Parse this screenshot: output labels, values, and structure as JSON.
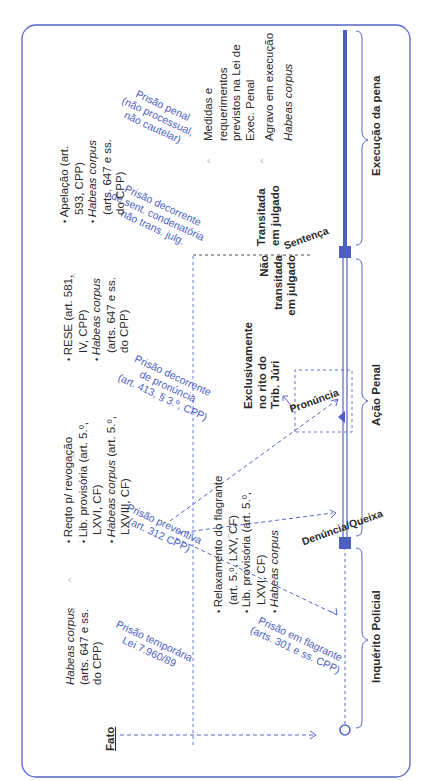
{
  "diagram": {
    "start_label": "Fato",
    "phases": [
      {
        "label": "Inquérito Policial"
      },
      {
        "label": "Ação Penal"
      },
      {
        "label": "Execução da pena"
      }
    ],
    "milestones": {
      "denuncia": "Denúncia/Queixa",
      "pronuncia": "Pronúncia",
      "sentenca": "Sentença"
    },
    "notes": {
      "juri": "Exclusivamente no rito do Trib. Júri",
      "nao_transitada": "Não transitada em julgado",
      "transitada": "Transitada em julgado"
    },
    "prisoes": {
      "temporaria": {
        "line1": "Prisão temporária",
        "line2": "Lei 7.960/89"
      },
      "flagrante": {
        "line1": "Prisão em flagrante",
        "line2": "(arts. 301 e ss. CPP)"
      },
      "preventiva": {
        "line1": "Prisão preventiva",
        "line2": "(art. 312 CPP)"
      },
      "pronuncia": {
        "line1": "Prisão decorrente",
        "line2": "de pronúncia",
        "line3": "(art. 413, § 3.º, CPP)"
      },
      "sentenca": {
        "line1": "Prisão decorrente",
        "line2": "de sent. condenatória",
        "line3": "não trans. julg."
      },
      "penal": {
        "line1": "Prisão penal",
        "line2": "(não processual,",
        "line3": "não cautelar)"
      }
    },
    "remedios": {
      "temporaria": [
        "Habeas corpus",
        "(arts. 647 e ss.",
        "do CPP)"
      ],
      "flagrante": [
        {
          "text": "Relaxamento do flagrante (art. 5.º, LXV, CF)"
        },
        {
          "text": "Lib. provisória (art. 5.º, LXVI, CF)"
        },
        {
          "text": "Habeas corpus",
          "italic": true
        }
      ],
      "preventiva": [
        {
          "text": "Reqto p/ revogação"
        },
        {
          "text": "Lib. provisória (art. 5.º, LXVI, CF)"
        },
        {
          "italic_part": "Habeas corpus",
          "text": " (art. 5.º, LXVIII, CF)"
        }
      ],
      "pronuncia": [
        {
          "text": "RESE (art. 581, IV, CPP)"
        },
        {
          "italic_part": "Habeas corpus",
          "text": " (arts. 647 e ss. do CPP)"
        }
      ],
      "sentenca": [
        {
          "text": "Apelação (art. 593, CPP)"
        },
        {
          "italic_part": "Habeas corpus",
          "text": " (arts. 647 e ss. do CPP)"
        }
      ],
      "penal": [
        {
          "text": "Medidas e requerimentos previstos na Lei de Exec. Penal"
        },
        {
          "text": "Agravo em execução"
        },
        {
          "text": "Habeas corpus",
          "italic": true
        }
      ]
    },
    "colors": {
      "accent": "#4d5fc4",
      "frame": "#5566c8",
      "text": "#2a2a2a",
      "chevron": "#c9c9c9"
    }
  }
}
